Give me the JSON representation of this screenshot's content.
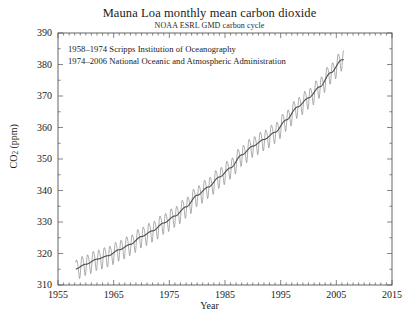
{
  "chart_data": {
    "type": "line",
    "title": "Mauna Loa monthly mean carbon dioxide",
    "subtitle": "NOAA ESRL GMD carbon cycle",
    "xlabel": "Year",
    "ylabel": "CO2 (ppm)",
    "ylabel_html": "CO",
    "ylabel_sub": "2",
    "ylabel_unit": " (ppm)",
    "xlim": [
      1955,
      2015
    ],
    "ylim": [
      310,
      390
    ],
    "xticks": [
      1955,
      1965,
      1975,
      1985,
      1995,
      2005,
      2015
    ],
    "yticks": [
      310,
      320,
      330,
      340,
      350,
      360,
      370,
      380,
      390
    ],
    "x_minor_step": 1,
    "y_minor_step": 5,
    "grid": false,
    "legend": "none",
    "annotations": [
      "1958–1974 Scripps Institution of Oceanography",
      "1974–2006 National Oceanic and Atmospheric Administration"
    ],
    "series": [
      {
        "name": "Monthly mean CO2",
        "color": "#8a8a8a",
        "style": "sawtooth-monthly",
        "seasonal_amplitude_ppm": 3.2,
        "x_start": 1958.2,
        "x_end": 2006.4
      },
      {
        "name": "Seasonally corrected trend",
        "color": "#4f4f4f",
        "style": "smooth-trend",
        "x_start": 1958.2,
        "x_end": 2006.4,
        "anchors_x": [
          1958,
          1960,
          1962,
          1964,
          1966,
          1968,
          1970,
          1972,
          1974,
          1976,
          1978,
          1980,
          1982,
          1984,
          1986,
          1988,
          1990,
          1992,
          1994,
          1996,
          1998,
          2000,
          2002,
          2004,
          2006
        ],
        "anchors_y": [
          315.0,
          316.6,
          318.2,
          319.3,
          321.2,
          322.9,
          325.4,
          327.2,
          329.7,
          331.9,
          334.8,
          338.5,
          341.1,
          344.3,
          347.2,
          351.3,
          354.1,
          356.2,
          358.5,
          362.4,
          366.5,
          369.4,
          372.9,
          377.4,
          381.5
        ]
      }
    ]
  }
}
